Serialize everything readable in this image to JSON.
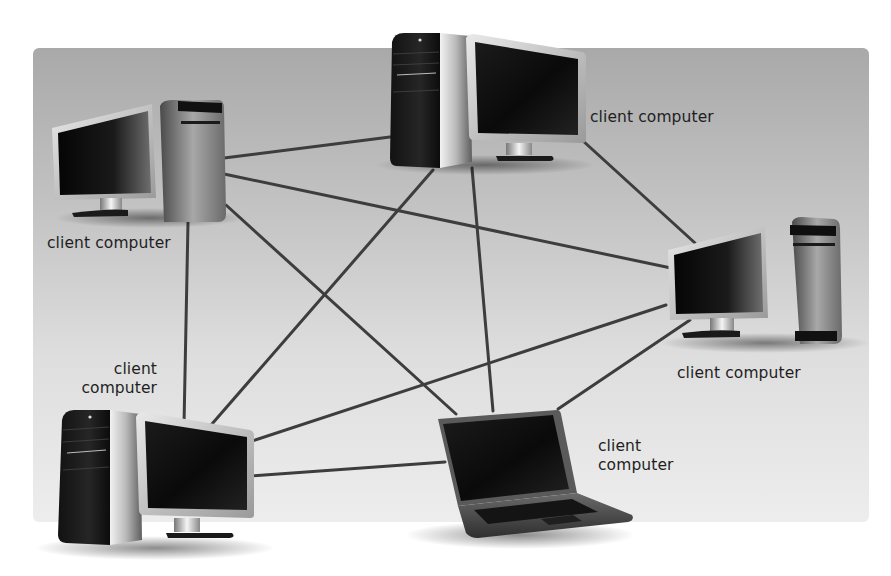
{
  "diagram": {
    "type": "peer-to-peer network",
    "panel": {
      "x": 33,
      "y": 48,
      "w": 836,
      "h": 474,
      "gradient_top": "#a9a9a9",
      "gradient_bottom": "#ededed"
    },
    "line_color": "#3d3d3d",
    "nodes": [
      {
        "id": "pc-top-left",
        "kind": "desktop",
        "label_lines": [
          "client computer"
        ]
      },
      {
        "id": "pc-top-center",
        "kind": "desktop",
        "label_lines": [
          "client computer"
        ]
      },
      {
        "id": "pc-right",
        "kind": "desktop",
        "label_lines": [
          "client computer"
        ]
      },
      {
        "id": "pc-bottom-left",
        "kind": "desktop",
        "label_lines": [
          "client",
          "computer"
        ]
      },
      {
        "id": "laptop-bottom",
        "kind": "laptop",
        "label_lines": [
          "client",
          "computer"
        ]
      }
    ],
    "connections": [
      {
        "from": "pc-top-left",
        "to": "pc-top-center",
        "x1": 224,
        "y1": 158,
        "x2": 390,
        "y2": 137
      },
      {
        "from": "pc-top-left",
        "to": "pc-right",
        "x1": 224,
        "y1": 174,
        "x2": 671,
        "y2": 268
      },
      {
        "from": "pc-top-left",
        "to": "laptop-bottom",
        "x1": 226,
        "y1": 205,
        "x2": 456,
        "y2": 414
      },
      {
        "from": "pc-top-left",
        "to": "pc-bottom-left",
        "x1": 188,
        "y1": 222,
        "x2": 184,
        "y2": 425
      },
      {
        "from": "pc-top-center",
        "to": "pc-bottom-left",
        "x1": 433,
        "y1": 170,
        "x2": 205,
        "y2": 432
      },
      {
        "from": "pc-top-center",
        "to": "laptop-bottom",
        "x1": 472,
        "y1": 168,
        "x2": 493,
        "y2": 411
      },
      {
        "from": "pc-top-center",
        "to": "pc-right",
        "x1": 582,
        "y1": 140,
        "x2": 695,
        "y2": 243
      },
      {
        "from": "pc-right",
        "to": "pc-bottom-left",
        "x1": 666,
        "y1": 305,
        "x2": 243,
        "y2": 444
      },
      {
        "from": "pc-right",
        "to": "laptop-bottom",
        "x1": 690,
        "y1": 320,
        "x2": 558,
        "y2": 409
      },
      {
        "from": "pc-bottom-left",
        "to": "laptop-bottom",
        "x1": 249,
        "y1": 476,
        "x2": 445,
        "y2": 462
      }
    ]
  },
  "labels": {
    "top_left": {
      "line1": "client computer"
    },
    "top_center": {
      "line1": "client computer"
    },
    "right": {
      "line1": "client computer"
    },
    "bottom_left": {
      "line1": "client",
      "line2": "computer"
    },
    "laptop": {
      "line1": "client",
      "line2": "computer"
    }
  }
}
